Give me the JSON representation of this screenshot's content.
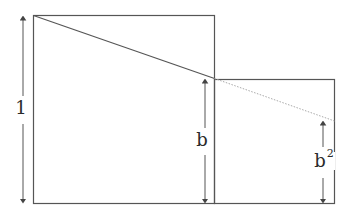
{
  "diagram": {
    "colors": {
      "stroke": "#555555",
      "dotted": "#aaaaaa",
      "text": "#2a2a2a",
      "background": "#ffffff"
    },
    "labels": {
      "large_side": "1",
      "small_side": "b",
      "extension_base": "b",
      "extension_exp": "2"
    },
    "shapes": {
      "large_square": {
        "x": 33,
        "y": 15,
        "width": 181,
        "height": 188
      },
      "small_square": {
        "x": 214,
        "y": 79,
        "width": 120,
        "height": 124
      },
      "diagonal": {
        "x1": 33,
        "y1": 15,
        "x2": 214,
        "y2": 78
      },
      "dotted_extension": {
        "x1": 214,
        "y1": 78,
        "x2": 334,
        "y2": 121
      }
    }
  }
}
